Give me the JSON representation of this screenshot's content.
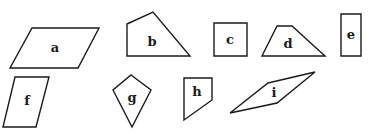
{
  "diagram": {
    "shapes": [
      {
        "id": "a",
        "label": "a",
        "type": "parallelogram",
        "points": "32,28 99,28 78,68 10,68",
        "label_pos": [
          55,
          48
        ]
      },
      {
        "id": "b",
        "label": "b",
        "type": "pentagon",
        "points": "127,24 153,12 190,56 127,56",
        "label_pos": [
          152,
          42
        ]
      },
      {
        "id": "c",
        "label": "c",
        "type": "square",
        "points": "214,23 247,23 247,56 214,56",
        "label_pos": [
          230,
          40
        ]
      },
      {
        "id": "d",
        "label": "d",
        "type": "trapezoid",
        "points": "277,26 292,26 325,56 262,56",
        "label_pos": [
          288,
          44
        ]
      },
      {
        "id": "e",
        "label": "e",
        "type": "rectangle",
        "points": "341,14 361,14 361,56 341,56",
        "label_pos": [
          351,
          35
        ]
      },
      {
        "id": "f",
        "label": "f",
        "type": "parallelogram",
        "points": "15,77 49,77 36,127 3,127",
        "label_pos": [
          27,
          101
        ]
      },
      {
        "id": "g",
        "label": "g",
        "type": "kite",
        "points": "131,75 151,90 132,127 113,90",
        "label_pos": [
          132,
          98
        ]
      },
      {
        "id": "h",
        "label": "h",
        "type": "pentagon",
        "points": "184,78 212,78 212,100 184,120",
        "label_pos": [
          197,
          92
        ]
      },
      {
        "id": "i",
        "label": "i",
        "type": "parallelogram",
        "points": "268,83 315,72 277,103 230,113",
        "label_pos": [
          274,
          93
        ]
      }
    ]
  }
}
